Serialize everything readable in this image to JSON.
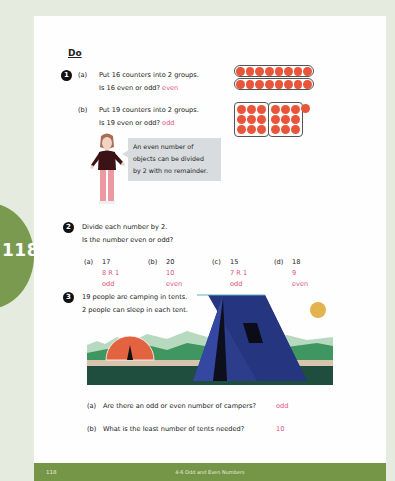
{
  "side_tab": {
    "page_number": "118"
  },
  "section": {
    "heading": "Do"
  },
  "q1": {
    "number": "1",
    "a": {
      "label": "(a)",
      "line1": "Put 16 counters into 2 groups.",
      "line2": "Is 16 even or odd?",
      "answer": "even"
    },
    "b": {
      "label": "(b)",
      "line1": "Put 19 counters into 2 groups.",
      "line2": "Is 19 even or odd?",
      "answer": "odd"
    },
    "speech_bubble": {
      "line1": "An even number of",
      "line2": "objects can be divided",
      "line3": "by 2 with no remainder."
    }
  },
  "q2": {
    "number": "2",
    "line1": "Divide each number by 2.",
    "line2": "Is the number even or odd?",
    "items": [
      {
        "label": "(a)",
        "number": "17",
        "quotient": "8 R 1",
        "parity": "odd"
      },
      {
        "label": "(b)",
        "number": "20",
        "quotient": "10",
        "parity": "even"
      },
      {
        "label": "(c)",
        "number": "15",
        "quotient": "7 R 1",
        "parity": "odd"
      },
      {
        "label": "(d)",
        "number": "18",
        "quotient": "9",
        "parity": "even"
      }
    ]
  },
  "q3": {
    "number": "3",
    "line1": "19 people are camping in tents.",
    "line2": "2 people can sleep in each tent.",
    "a": {
      "label": "(a)",
      "question": "Are there an odd or even number of campers?",
      "answer": "odd"
    },
    "b": {
      "label": "(b)",
      "question": "What is the least number of tents needed?",
      "answer": "10"
    }
  },
  "footer": {
    "page_number": "118",
    "title": "4-6 Odd and Even Numbers"
  },
  "colors": {
    "accent_green": "#759547",
    "answer_pink": "#e0547e",
    "counter_red": "#e9553a",
    "tent_blue": "#2f3c8f"
  }
}
